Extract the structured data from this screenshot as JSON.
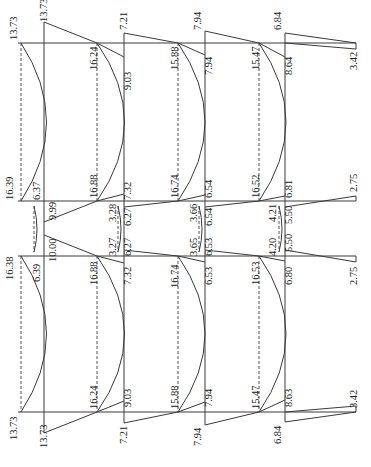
{
  "orientation": "rotated 90deg clockwise; labels read bottom-to-top",
  "units": "kN·m",
  "frame": {
    "column_lines_x": [
      44,
      124,
      205,
      285
    ],
    "beam_baselines_dashed_x": [
      18,
      97,
      178,
      259
    ],
    "horizontal_lines_y": [
      43,
      201,
      256,
      412
    ]
  },
  "labels": {
    "top_left_end": "13.73",
    "top_left_end2": "13.73",
    "r1_top": "16.24",
    "r1_top_mid": "9.03",
    "r1_top_col": "7.21",
    "r2_top": "15.88",
    "r2_top_mid": "7.94",
    "r2_top_col": "7.94",
    "r3_top": "15.47",
    "r3_top_mid": "8.64",
    "r3_top_col": "6.84",
    "r3_top_end": "3.42",
    "l_upper_mid": "16.39",
    "l_upper_col": "6.37",
    "l_upper_col2": "9.99",
    "r1_upper_mid": "16.88",
    "r1_upper_col": "7.32",
    "r2_upper_mid": "16.74",
    "r2_upper_col": "6.54",
    "r3_upper_mid": "16.52",
    "r3_upper_col": "6.81",
    "r3_upper_end": "2.75",
    "c1_upper": "3.28",
    "c1_upper2": "6.27",
    "c2_upper": "3.66",
    "c2_upper2": "6.54",
    "c3_upper": "4.21",
    "c3_upper2": "5.50",
    "l_lower_mid": "16.38",
    "l_lower_col": "6.39",
    "l_lower_col2": "10.00",
    "c1_lower": "3.27",
    "c1_lower2": "6.27",
    "c2_lower": "3.65",
    "c2_lower2": "6.53",
    "c3_lower": "4.20",
    "c3_lower2": "5.50",
    "r1_lower_mid": "16.88",
    "r1_lower_col": "7.32",
    "r2_lower_mid": "16.74",
    "r2_lower_col": "6.53",
    "r3_lower_mid": "16.53",
    "r3_lower_col": "6.80",
    "r3_lower_end": "2.75",
    "bot_left_end": "13.73",
    "bot_left_end2": "13.73",
    "r1_bot": "16.24",
    "r1_bot_mid": "9.03",
    "r1_bot_col": "7.21",
    "r2_bot": "15.88",
    "r2_bot_mid": "7.94",
    "r2_bot_col": "7.94",
    "r3_bot": "15.47",
    "r3_bot_mid": "8.63",
    "r3_bot_col": "6.84",
    "r3_bot_end": "3.42"
  }
}
